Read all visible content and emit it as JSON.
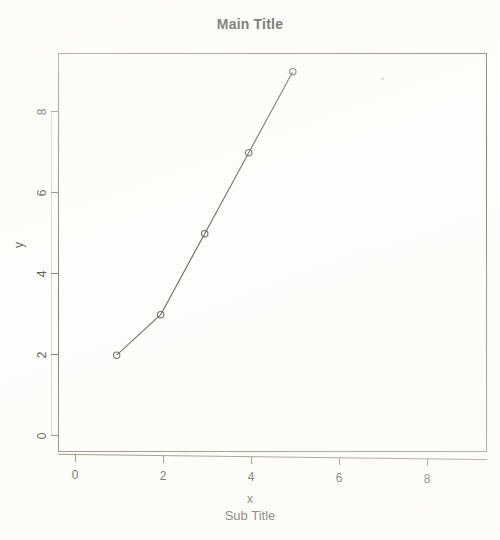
{
  "titles": {
    "main": "Main Title",
    "sub": "Sub Title",
    "xlab": "x",
    "ylab": "y"
  },
  "colors": {
    "axis": "#8a8a74",
    "line": "#6b6b63",
    "point_stroke": "#6b6b63",
    "text": "#55554e",
    "title_text": "#3b3b36",
    "background": "#fdfdfb"
  },
  "axes": {
    "x_ticks": [
      "0",
      "2",
      "4",
      "6",
      "8"
    ],
    "x_tick_values": [
      0,
      2,
      4,
      6,
      8
    ],
    "y_ticks": [
      "0",
      "2",
      "4",
      "6",
      "8"
    ],
    "y_tick_values": [
      0,
      2,
      4,
      6,
      8
    ],
    "x_range": [
      -0.32,
      9.4
    ],
    "y_range": [
      -0.38,
      9.45
    ]
  },
  "chart_data": {
    "type": "line",
    "title": "Main Title",
    "subtitle": "Sub Title",
    "xlabel": "x",
    "ylabel": "y",
    "x": [
      1,
      2,
      3,
      4,
      5
    ],
    "values": [
      2,
      3,
      5,
      7,
      9
    ],
    "series": [
      {
        "name": "y",
        "x": [
          1,
          2,
          3,
          4,
          5
        ],
        "values": [
          2,
          3,
          5,
          7,
          9
        ]
      }
    ],
    "marker": "open-circle",
    "line_style": "solid",
    "grid": false,
    "legend": null,
    "xlim": [
      -0.32,
      9.4
    ],
    "ylim": [
      -0.38,
      9.45
    ],
    "xticks": [
      0,
      2,
      4,
      6,
      8
    ],
    "yticks": [
      0,
      2,
      4,
      6,
      8
    ],
    "box": "full-rectangle"
  }
}
